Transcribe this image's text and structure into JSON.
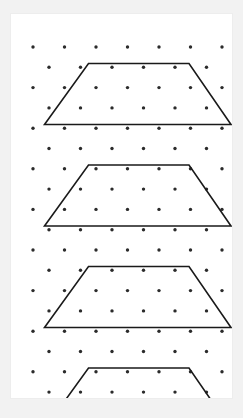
{
  "page": {
    "background_color": "#f2f2f2"
  },
  "card": {
    "background_color": "#ffffff",
    "border_color": "#ededed",
    "x": 10,
    "y": 13,
    "width": 223,
    "height": 386
  },
  "figure": {
    "name": "dot-grid-trapezoids",
    "width": 243,
    "height": 418,
    "dot_color": "#2b2b2b",
    "dot_radius": 1.7,
    "line_color": "#1a1a1a",
    "line_width": 1.6,
    "grid": {
      "type": "staggered-triangular",
      "columns_even_row": 7,
      "columns_odd_row": 6,
      "even_row_start_x": 22,
      "odd_row_start_x": 38,
      "column_spacing": 31.5,
      "row_spacing": 20.3,
      "first_row_y": 33,
      "row_count": 19
    },
    "shapes": [
      {
        "name": "trapezoid-1",
        "label": "Trapezoid 1",
        "points": [
          [
            77.5,
            49.5
          ],
          [
            178.0,
            49.5
          ],
          [
            220.0,
            110.5
          ],
          [
            33.5,
            110.5
          ]
        ],
        "closed": true
      },
      {
        "name": "trapezoid-2",
        "label": "Trapezoid 2",
        "points": [
          [
            77.5,
            151.0
          ],
          [
            178.0,
            151.0
          ],
          [
            220.0,
            212.0
          ],
          [
            33.5,
            212.0
          ]
        ],
        "closed": true
      },
      {
        "name": "trapezoid-3",
        "label": "Trapezoid 3",
        "points": [
          [
            77.5,
            252.5
          ],
          [
            178.0,
            252.5
          ],
          [
            220.0,
            313.5
          ],
          [
            33.5,
            313.5
          ]
        ],
        "closed": true
      },
      {
        "name": "trapezoid-4",
        "label": "Trapezoid 4",
        "points": [
          [
            77.5,
            354.0
          ],
          [
            178.0,
            354.0
          ],
          [
            220.0,
            415.0
          ],
          [
            33.5,
            415.0
          ]
        ],
        "closed": true
      }
    ]
  },
  "chart_data": {
    "type": "scatter",
    "xlabel": "",
    "ylabel": "",
    "shape_count": 4,
    "shape_type": "trapezoid"
  }
}
